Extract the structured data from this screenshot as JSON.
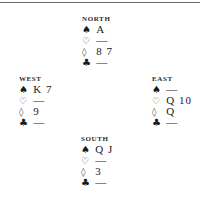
{
  "diagram": {
    "north": {
      "label": "NORTH",
      "spades": {
        "symbol": "♠",
        "cards": "A"
      },
      "hearts": {
        "symbol": "♡",
        "cards": "—"
      },
      "diamonds": {
        "symbol": "◊",
        "cards": "8 7"
      },
      "clubs": {
        "symbol": "♣",
        "cards": "—"
      }
    },
    "west": {
      "label": "WEST",
      "spades": {
        "symbol": "♠",
        "cards": "K 7"
      },
      "hearts": {
        "symbol": "♡",
        "cards": "—"
      },
      "diamonds": {
        "symbol": "◊",
        "cards": "9"
      },
      "clubs": {
        "symbol": "♣",
        "cards": "—"
      }
    },
    "east": {
      "label": "EAST",
      "spades": {
        "symbol": "♠",
        "cards": "—"
      },
      "hearts": {
        "symbol": "♡",
        "cards": "Q 10"
      },
      "diamonds": {
        "symbol": "◊",
        "cards": "Q"
      },
      "clubs": {
        "symbol": "♣",
        "cards": "—"
      }
    },
    "south": {
      "label": "SOUTH",
      "spades": {
        "symbol": "♠",
        "cards": "Q J"
      },
      "hearts": {
        "symbol": "♡",
        "cards": "—"
      },
      "diamonds": {
        "symbol": "◊",
        "cards": "3"
      },
      "clubs": {
        "symbol": "♣",
        "cards": "—"
      }
    }
  }
}
